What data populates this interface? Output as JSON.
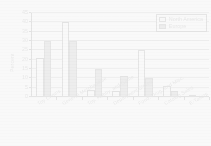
{
  "chart_data": {
    "type": "bar",
    "title": "",
    "subtitle": "",
    "xlabel": "",
    "ylabel": "Percent",
    "ylim": [
      0,
      45
    ],
    "ytick_step": 5,
    "yticks": [
      "0",
      "5",
      "10",
      "15",
      "20",
      "25",
      "30",
      "35",
      "40",
      "45"
    ],
    "grid": true,
    "legend_position": "top-right",
    "categories": [
      "Toy Chains",
      "General Merchandise",
      "Toy, Hobby, and Game",
      "Department Stores",
      "Food, Drug, and Misc.",
      "Catalog Sales",
      "E-Tailers"
    ],
    "series": [
      {
        "name": "North America",
        "color": "#fbfbfb",
        "values": [
          21,
          40,
          4,
          3,
          25,
          6,
          1
        ]
      },
      {
        "name": "Europe",
        "color": "#7d7d7d",
        "values": [
          30,
          30,
          15,
          11.5,
          10,
          3,
          0
        ]
      }
    ]
  },
  "legend": {
    "items": [
      {
        "label": "North America",
        "swatch": "na"
      },
      {
        "label": "Europe",
        "swatch": "eu"
      }
    ]
  }
}
